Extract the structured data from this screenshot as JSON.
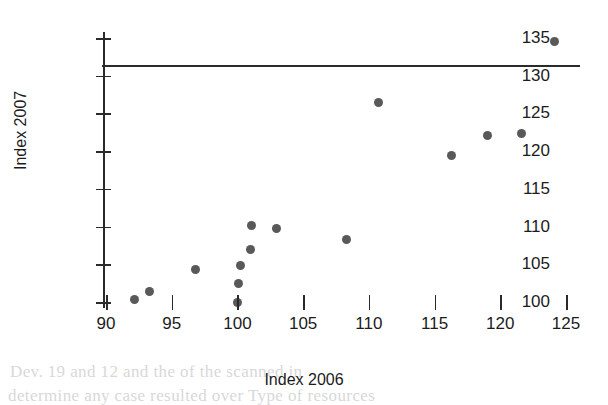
{
  "chart_data": {
    "type": "scatter",
    "title": "",
    "xlabel": "Index 2006",
    "ylabel": "Index 2007",
    "xlim": [
      90,
      125
    ],
    "ylim": [
      98,
      136
    ],
    "xticks": [
      90,
      95,
      100,
      105,
      110,
      115,
      120,
      125
    ],
    "yticks": [
      100,
      105,
      110,
      115,
      120,
      125,
      130,
      135
    ],
    "xtick_labels": [
      "90",
      "95",
      "100",
      "105",
      "110",
      "115",
      "120",
      "125"
    ],
    "ytick_labels": [
      "100",
      "105",
      "110",
      "115",
      "120",
      "125",
      "130",
      "135"
    ],
    "grid": false,
    "legend": null,
    "marker": {
      "shape": "circle",
      "color": "#595959",
      "size": 9
    },
    "points": [
      {
        "x": 92.2,
        "y": 100.3
      },
      {
        "x": 93.3,
        "y": 101.4
      },
      {
        "x": 96.8,
        "y": 104.3
      },
      {
        "x": 100.0,
        "y": 99.9
      },
      {
        "x": 100.1,
        "y": 102.4
      },
      {
        "x": 100.2,
        "y": 104.9
      },
      {
        "x": 101.0,
        "y": 107.0
      },
      {
        "x": 101.1,
        "y": 110.2
      },
      {
        "x": 103.0,
        "y": 109.7
      },
      {
        "x": 108.3,
        "y": 108.3
      },
      {
        "x": 110.7,
        "y": 126.4
      },
      {
        "x": 116.3,
        "y": 119.4
      },
      {
        "x": 119.0,
        "y": 122.1
      },
      {
        "x": 121.6,
        "y": 122.3
      },
      {
        "x": 124.1,
        "y": 134.6
      }
    ]
  },
  "background_text": {
    "line1": "Dev. 19 and 12 and the of the scanned in",
    "line2": "determine any case resulted over Type of resources"
  }
}
